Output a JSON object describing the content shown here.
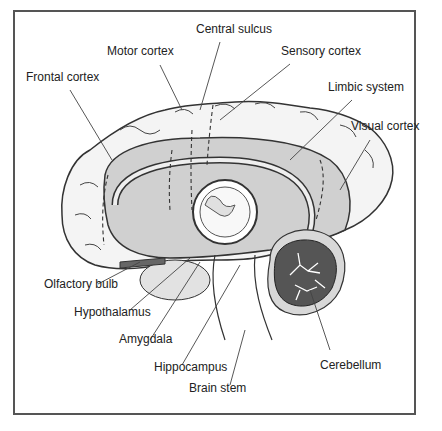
{
  "diagram": {
    "type": "anatomical-illustration",
    "labels": [
      {
        "id": "central-sulcus",
        "text": "Central sulcus",
        "x": 196,
        "y": 28
      },
      {
        "id": "motor-cortex",
        "text": "Motor cortex",
        "x": 107,
        "y": 50
      },
      {
        "id": "sensory-cortex",
        "text": "Sensory cortex",
        "x": 281,
        "y": 50
      },
      {
        "id": "frontal-cortex",
        "text": "Frontal cortex",
        "x": 26,
        "y": 76
      },
      {
        "id": "limbic-system",
        "text": "Limbic system",
        "x": 328,
        "y": 86
      },
      {
        "id": "visual-cortex",
        "text": "Visual cortex",
        "x": 351,
        "y": 125
      },
      {
        "id": "olfactory-bulb",
        "text": "Olfactory bulb",
        "x": 44,
        "y": 283
      },
      {
        "id": "hypothalamus",
        "text": "Hypothalamus",
        "x": 74,
        "y": 311
      },
      {
        "id": "amygdala",
        "text": "Amygdala",
        "x": 119,
        "y": 338
      },
      {
        "id": "hippocampus",
        "text": "Hippocampus",
        "x": 154,
        "y": 366
      },
      {
        "id": "brain-stem",
        "text": "Brain stem",
        "x": 189,
        "y": 387
      },
      {
        "id": "cerebellum",
        "text": "Cerebellum",
        "x": 320,
        "y": 355
      }
    ],
    "colors": {
      "frame": "#555555",
      "outline": "#333333",
      "cortex": "#f4f4f4",
      "limbic": "#cfcfcf",
      "cerebellum": "#555555",
      "leader": "#444444"
    }
  }
}
